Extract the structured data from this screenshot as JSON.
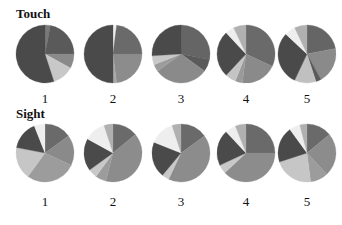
{
  "chart_data": [
    {
      "type": "pie",
      "title": "Touch",
      "pies": [
        {
          "label": "1",
          "slices": [
            {
              "value": 3,
              "color": "#7a7a7a"
            },
            {
              "value": 22,
              "color": "#5a5a5a"
            },
            {
              "value": 8,
              "color": "#8a8a8a"
            },
            {
              "value": 12,
              "color": "#c8c8c8"
            },
            {
              "value": 55,
              "color": "#4a4a4a"
            }
          ]
        },
        {
          "label": "2",
          "slices": [
            {
              "value": 2,
              "color": "#eeeeee"
            },
            {
              "value": 23,
              "color": "#6a6a6a"
            },
            {
              "value": 23,
              "color": "#8c8c8c"
            },
            {
              "value": 2,
              "color": "#a8a8a8"
            },
            {
              "value": 50,
              "color": "#4a4a4a"
            }
          ]
        },
        {
          "label": "3",
          "slices": [
            {
              "value": 28,
              "color": "#656565"
            },
            {
              "value": 7,
              "color": "#5a5a5a"
            },
            {
              "value": 30,
              "color": "#8a8a8a"
            },
            {
              "value": 4,
              "color": "#9c9c9c"
            },
            {
              "value": 5,
              "color": "#c8c8c8"
            },
            {
              "value": 26,
              "color": "#4a4a4a"
            }
          ]
        },
        {
          "label": "4",
          "slices": [
            {
              "value": 32,
              "color": "#6a6a6a"
            },
            {
              "value": 20,
              "color": "#8a8a8a"
            },
            {
              "value": 4,
              "color": "#9a9a9a"
            },
            {
              "value": 6,
              "color": "#c4c4c4"
            },
            {
              "value": 26,
              "color": "#4a4a4a"
            },
            {
              "value": 5,
              "color": "#eeeeee"
            },
            {
              "value": 7,
              "color": "#b0b0b0"
            }
          ]
        },
        {
          "label": "5",
          "slices": [
            {
              "value": 22,
              "color": "#656565"
            },
            {
              "value": 20,
              "color": "#8a8a8a"
            },
            {
              "value": 3,
              "color": "#5a5a5a"
            },
            {
              "value": 12,
              "color": "#c0c0c0"
            },
            {
              "value": 30,
              "color": "#4a4a4a"
            },
            {
              "value": 6,
              "color": "#eeeeee"
            },
            {
              "value": 7,
              "color": "#b0b0b0"
            }
          ]
        }
      ]
    },
    {
      "type": "pie",
      "title": "Sight",
      "pies": [
        {
          "label": "1",
          "slices": [
            {
              "value": 15,
              "color": "#6a6a6a"
            },
            {
              "value": 17,
              "color": "#8a8a8a"
            },
            {
              "value": 28,
              "color": "#9c9c9c"
            },
            {
              "value": 18,
              "color": "#c6c6c6"
            },
            {
              "value": 16,
              "color": "#4a4a4a"
            },
            {
              "value": 6,
              "color": "#eeeeee"
            }
          ]
        },
        {
          "label": "2",
          "slices": [
            {
              "value": 14,
              "color": "#6a6a6a"
            },
            {
              "value": 40,
              "color": "#8c8c8c"
            },
            {
              "value": 6,
              "color": "#9c9c9c"
            },
            {
              "value": 5,
              "color": "#c8c8c8"
            },
            {
              "value": 18,
              "color": "#4a4a4a"
            },
            {
              "value": 12,
              "color": "#eeeeee"
            },
            {
              "value": 5,
              "color": "#b0b0b0"
            }
          ]
        },
        {
          "label": "3",
          "slices": [
            {
              "value": 15,
              "color": "#6a6a6a"
            },
            {
              "value": 42,
              "color": "#8c8c8c"
            },
            {
              "value": 4,
              "color": "#c8c8c8"
            },
            {
              "value": 20,
              "color": "#4a4a4a"
            },
            {
              "value": 14,
              "color": "#eeeeee"
            },
            {
              "value": 5,
              "color": "#b0b0b0"
            }
          ]
        },
        {
          "label": "4",
          "slices": [
            {
              "value": 25,
              "color": "#6a6a6a"
            },
            {
              "value": 38,
              "color": "#8c8c8c"
            },
            {
              "value": 5,
              "color": "#c8c8c8"
            },
            {
              "value": 20,
              "color": "#4a4a4a"
            },
            {
              "value": 6,
              "color": "#eeeeee"
            },
            {
              "value": 6,
              "color": "#b0b0b0"
            }
          ]
        },
        {
          "label": "5",
          "slices": [
            {
              "value": 14,
              "color": "#6a6a6a"
            },
            {
              "value": 24,
              "color": "#8c8c8c"
            },
            {
              "value": 10,
              "color": "#9c9c9c"
            },
            {
              "value": 22,
              "color": "#c6c6c6"
            },
            {
              "value": 20,
              "color": "#4a4a4a"
            },
            {
              "value": 6,
              "color": "#eeeeee"
            },
            {
              "value": 4,
              "color": "#b0b0b0"
            }
          ]
        }
      ]
    }
  ],
  "rows": [
    {
      "title": "Touch",
      "labels": [
        "1",
        "2",
        "3",
        "4",
        "5"
      ]
    },
    {
      "title": "Sight",
      "labels": [
        "1",
        "2",
        "3",
        "4",
        "5"
      ]
    }
  ]
}
